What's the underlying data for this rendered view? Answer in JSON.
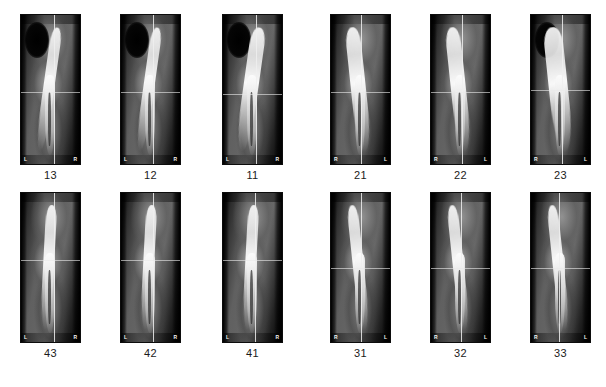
{
  "figure": {
    "background_color": "#ffffff",
    "panel_background": "#000000",
    "caption_color": "#1a1a1a",
    "crosshair_color": "#eeeeee",
    "rows": 2,
    "columns": 6
  },
  "rows": [
    {
      "row_name": "maxillary-anterior",
      "panels": [
        {
          "tooth_number": "13",
          "orient_left": "L",
          "orient_right": "R",
          "crosshair_x_pct": 56,
          "crosshair_y_pct": 52,
          "tooth_class": "tooth t-narrow lean-r",
          "has_sinus": true,
          "has_canal": true
        },
        {
          "tooth_number": "12",
          "orient_left": "L",
          "orient_right": "R",
          "crosshair_x_pct": 54,
          "crosshair_y_pct": 52,
          "tooth_class": "tooth t-narrow lean-r",
          "has_sinus": true,
          "has_canal": true
        },
        {
          "tooth_number": "11",
          "orient_left": "L",
          "orient_right": "R",
          "crosshair_x_pct": 56,
          "crosshair_y_pct": 53,
          "tooth_class": "tooth lean-r",
          "has_sinus": true,
          "has_canal": true
        },
        {
          "tooth_number": "21",
          "orient_left": "R",
          "orient_right": "L",
          "crosshair_x_pct": 50,
          "crosshair_y_pct": 52,
          "tooth_class": "tooth lean-l",
          "has_sinus": false,
          "has_canal": true
        },
        {
          "tooth_number": "22",
          "orient_left": "R",
          "orient_right": "L",
          "crosshair_x_pct": 52,
          "crosshair_y_pct": 52,
          "tooth_class": "tooth lean-l",
          "has_sinus": false,
          "has_canal": true
        },
        {
          "tooth_number": "23",
          "orient_left": "R",
          "orient_right": "L",
          "crosshair_x_pct": 52,
          "crosshair_y_pct": 50,
          "tooth_class": "tooth t-wide lean-l",
          "has_sinus": true,
          "has_canal": true
        }
      ]
    },
    {
      "row_name": "mandibular-anterior",
      "panels": [
        {
          "tooth_number": "43",
          "orient_left": "L",
          "orient_right": "R",
          "crosshair_x_pct": 56,
          "crosshair_y_pct": 45,
          "tooth_class": "tooth t-narrow",
          "has_sinus": false,
          "has_canal": true
        },
        {
          "tooth_number": "42",
          "orient_left": "L",
          "orient_right": "R",
          "crosshair_x_pct": 54,
          "crosshair_y_pct": 45,
          "tooth_class": "tooth t-narrow",
          "has_sinus": false,
          "has_canal": true
        },
        {
          "tooth_number": "41",
          "orient_left": "L",
          "orient_right": "R",
          "crosshair_x_pct": 55,
          "crosshair_y_pct": 45,
          "tooth_class": "tooth t-narrow",
          "has_sinus": false,
          "has_canal": true
        },
        {
          "tooth_number": "31",
          "orient_left": "R",
          "orient_right": "L",
          "crosshair_x_pct": 50,
          "crosshair_y_pct": 50,
          "tooth_class": "tooth t-narrow lean-l",
          "has_sinus": false,
          "has_canal": true
        },
        {
          "tooth_number": "32",
          "orient_left": "R",
          "orient_right": "L",
          "crosshair_x_pct": 50,
          "crosshair_y_pct": 50,
          "tooth_class": "tooth t-narrow lean-l",
          "has_sinus": false,
          "has_canal": true
        },
        {
          "tooth_number": "33",
          "orient_left": "R",
          "orient_right": "L",
          "crosshair_x_pct": 48,
          "crosshair_y_pct": 50,
          "tooth_class": "tooth t-narrow lean-l",
          "has_sinus": false,
          "has_canal": true
        }
      ]
    }
  ],
  "layout": {
    "panel_left_positions": [
      20,
      120,
      222,
      330,
      430,
      530
    ],
    "panel_width": 61,
    "panel_height": 151,
    "row_tops": [
      14,
      192
    ],
    "caption_offset": 155
  }
}
